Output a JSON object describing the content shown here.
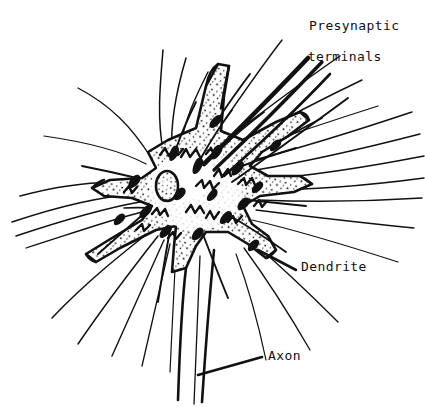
{
  "figure": {
    "type": "line-drawing",
    "width": 425,
    "height": 407,
    "background_color": "#ffffff",
    "ink_color": "#111111",
    "style": "hand-drawn pen-and-ink anatomical illustration"
  },
  "labels": {
    "presynaptic_line1": "Presynaptic",
    "presynaptic_line2": "terminals",
    "dendrite": "Dendrite",
    "axon": "Axon"
  },
  "structures": {
    "soma": "cell body with stippled cytoplasm",
    "nucleus": "oval nucleus with stippled interior",
    "dendrites": "five tapering stippled processes",
    "axon": "single narrow process descending from lower soma",
    "boutons": "dark teardrop presynaptic terminals on soma surface",
    "fibers": "afferent axon fibers converging from all directions"
  }
}
